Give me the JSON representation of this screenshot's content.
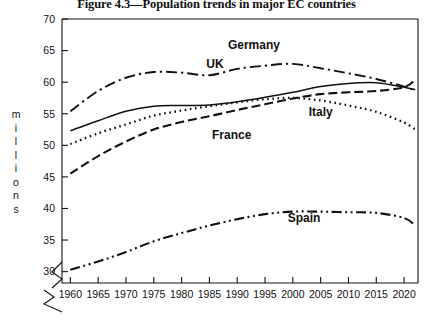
{
  "figure": {
    "title": "Figure 4.3—Population trends in major EC countries"
  },
  "axes": {
    "ylabel_text": "millions",
    "ylabel_letters": [
      "m",
      "i",
      "l",
      "l",
      "i",
      "o",
      "n",
      "s"
    ],
    "yticks": [
      30,
      35,
      40,
      45,
      50,
      55,
      60,
      65,
      70
    ],
    "xticks": [
      1960,
      1965,
      1970,
      1975,
      1980,
      1985,
      1990,
      1995,
      2000,
      2005,
      2010,
      2015,
      2020
    ],
    "ylim": [
      28.2,
      70
    ],
    "xlim": [
      1958.5,
      2022.5
    ],
    "y_axis_break": true,
    "x_axis_break": true
  },
  "labels": {
    "germany": "Germany",
    "uk": "UK",
    "france": "France",
    "italy": "Italy",
    "spain": "Spain"
  },
  "colors": {
    "ink": "#111111",
    "background": "#ffffff"
  },
  "chart_data": {
    "type": "line",
    "title": "Figure 4.3—Population trends in major EC countries",
    "xlabel": "",
    "ylabel": "millions",
    "xlim": [
      1958.5,
      2022.5
    ],
    "ylim": [
      28.2,
      70
    ],
    "grid": false,
    "legend": "inline-annotations",
    "x": [
      1960,
      1965,
      1970,
      1975,
      1980,
      1985,
      1990,
      1995,
      2000,
      2005,
      2010,
      2015,
      2020,
      2022
    ],
    "series": [
      {
        "name": "Germany",
        "linestyle": "dashdot",
        "label_position": {
          "x": 1993,
          "y": 65.2
        },
        "values": [
          55.4,
          58.6,
          60.7,
          61.6,
          61.5,
          61.1,
          62.1,
          62.6,
          62.9,
          62.2,
          61.4,
          60.5,
          59.3,
          58.7
        ]
      },
      {
        "name": "UK",
        "linestyle": "solid",
        "label_position": {
          "x": 1986,
          "y": 62.3
        },
        "values": [
          52.3,
          53.9,
          55.4,
          56.2,
          56.3,
          56.4,
          56.9,
          57.6,
          58.4,
          59.3,
          59.8,
          59.9,
          59.2,
          58.8
        ]
      },
      {
        "name": "France",
        "linestyle": "dashed",
        "label_position": {
          "x": 1989,
          "y": 51.0
        },
        "values": [
          45.5,
          48.3,
          50.6,
          52.5,
          53.7,
          54.6,
          55.6,
          56.5,
          57.4,
          58.1,
          58.4,
          58.6,
          59.2,
          60.4
        ]
      },
      {
        "name": "Italy",
        "linestyle": "dotted",
        "label_position": {
          "x": 2005,
          "y": 54.6
        },
        "values": [
          50.2,
          51.9,
          53.3,
          54.7,
          55.5,
          56.2,
          56.8,
          57.3,
          57.5,
          57.1,
          56.3,
          55.3,
          53.6,
          52.5
        ]
      },
      {
        "name": "Spain",
        "linestyle": "dashdotdot",
        "label_position": {
          "x": 2002,
          "y": 37.8
        },
        "values": [
          30.3,
          31.6,
          33.1,
          34.8,
          36.1,
          37.3,
          38.3,
          39.1,
          39.5,
          39.5,
          39.4,
          39.3,
          38.5,
          37.3
        ]
      }
    ]
  }
}
